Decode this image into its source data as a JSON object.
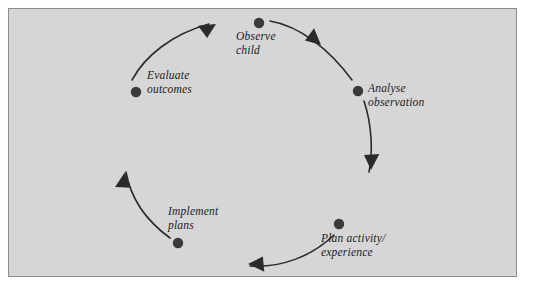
{
  "figure": {
    "panel": {
      "background_color": "#d6d6d6",
      "border_color": "#8d8d8d"
    },
    "stroke_color": "#2b2b2b",
    "node_color": "#3a3a3a",
    "page_background": "#ffffff"
  },
  "diagram_data": {
    "type": "cycle",
    "direction": "clockwise",
    "center": [
      248,
      145
    ],
    "radius": 122,
    "node_count": 5,
    "arrow_count": 5,
    "nodes": [
      {
        "id": "observe-child",
        "label": "Observe\nchild",
        "angle_deg": -85,
        "dot": [
          259,
          23
        ],
        "label_pos": [
          236,
          30
        ],
        "align": "left"
      },
      {
        "id": "analyse-observation",
        "label": "Analyse\nobservation",
        "angle_deg": -26,
        "dot": [
          358,
          91
        ],
        "label_pos": [
          368,
          82
        ],
        "align": "left"
      },
      {
        "id": "plan-activity-experience",
        "label": "Plan activity/\nexperience",
        "angle_deg": 41,
        "dot": [
          339,
          224
        ],
        "label_pos": [
          321,
          232
        ],
        "align": "left"
      },
      {
        "id": "implement-plans",
        "label": "Implement\nplans",
        "angle_deg": 125,
        "dot": [
          178,
          243
        ],
        "label_pos": [
          168,
          205
        ],
        "align": "left"
      },
      {
        "id": "evaluate-outcomes",
        "label": "Evaluate\noutcomes",
        "angle_deg": -155,
        "dot": [
          136,
          92
        ],
        "label_pos": [
          147,
          69
        ],
        "align": "left"
      }
    ],
    "arrows": [
      {
        "id": "arrow-observe-to-analyse",
        "from": "observe-child",
        "to": "analyse-observation",
        "head_at": [
          321,
          45
        ],
        "head_angle_deg": 48
      },
      {
        "id": "arrow-analyse-to-plan",
        "from": "analyse-observation",
        "to": "plan-activity-experience",
        "head_at": [
          369,
          166
        ],
        "head_angle_deg": 98
      },
      {
        "id": "arrow-plan-to-implement",
        "from": "plan-activity-experience",
        "to": "implement-plans",
        "head_at": [
          250,
          264
        ],
        "head_angle_deg": 185
      },
      {
        "id": "arrow-implement-to-evaluate",
        "from": "implement-plans",
        "to": "evaluate-outcomes",
        "head_at": [
          126,
          176
        ],
        "head_angle_deg": 284
      },
      {
        "id": "arrow-evaluate-to-observe",
        "from": "evaluate-outcomes",
        "to": "observe-child",
        "head_at": [
          213,
          24
        ],
        "head_angle_deg": 336
      }
    ]
  }
}
